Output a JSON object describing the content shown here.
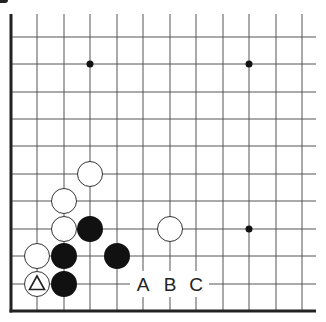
{
  "diagram": {
    "type": "go-board-fragment",
    "view": "lower-left corner, left and bottom edges visible",
    "colors": {
      "background": "#ffffff",
      "grid_line": "#555555",
      "edge_line": "#222222",
      "black_stone": "#111111",
      "white_stone_fill": "#ffffff",
      "white_stone_stroke": "#333333",
      "label": "#222222"
    },
    "grid": {
      "columns_x": [
        11,
        37,
        64,
        90,
        117,
        143,
        170,
        196,
        223,
        249,
        276,
        302
      ],
      "rows_y": [
        311,
        284,
        256,
        229,
        201,
        174,
        146,
        119,
        92,
        64,
        37
      ],
      "top_y": 14,
      "right_x": 316
    },
    "star_points": [
      {
        "col": 3,
        "row": 9
      },
      {
        "col": 9,
        "row": 9
      },
      {
        "col": 9,
        "row": 3
      }
    ],
    "stones": [
      {
        "color": "white",
        "col": 1,
        "row": 1,
        "marker": "triangle"
      },
      {
        "color": "black",
        "col": 2,
        "row": 1
      },
      {
        "color": "white",
        "col": 1,
        "row": 2
      },
      {
        "color": "black",
        "col": 2,
        "row": 2
      },
      {
        "color": "black",
        "col": 4,
        "row": 2
      },
      {
        "color": "white",
        "col": 2,
        "row": 3
      },
      {
        "color": "black",
        "col": 3,
        "row": 3
      },
      {
        "color": "white",
        "col": 2,
        "row": 4
      },
      {
        "color": "white",
        "col": 3,
        "row": 5
      },
      {
        "color": "white",
        "col": 6,
        "row": 3
      }
    ],
    "labels": [
      {
        "text": "A",
        "col": 5,
        "row": 1
      },
      {
        "text": "B",
        "col": 6,
        "row": 1
      },
      {
        "text": "C",
        "col": 7,
        "row": 1
      }
    ]
  }
}
